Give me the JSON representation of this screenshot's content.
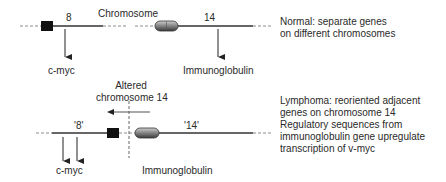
{
  "normal": {
    "title_label": "Chromosome",
    "chromosome_8_label": "8",
    "chromosome_14_label": "14",
    "gene_left": "c-myc",
    "gene_right": "Immunoglobulin",
    "caption": [
      "Normal: separate genes",
      "on different chromosomes"
    ]
  },
  "lymphoma": {
    "altered_label": [
      "Altered",
      "chromosome 14"
    ],
    "segment_8_label": "'8'",
    "segment_14_label": "'14'",
    "gene_left": "c-myc",
    "gene_right": "Immunoglobulin",
    "caption": [
      "Lymphoma: reoriented adjacent",
      "genes on chromosome 14",
      "Regulatory sequences from",
      "immunoglobulin gene upregulate",
      "transcription of v-myc"
    ]
  },
  "colors": {
    "line": "#333333",
    "dash": "#8a8a8a",
    "gene_box": "#111111",
    "oval_fill": "#8c8c8c"
  }
}
